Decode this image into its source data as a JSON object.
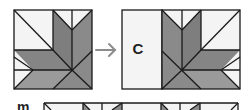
{
  "figure": {
    "labels": {
      "strip": "C",
      "row": "m"
    },
    "colors": {
      "white": "#f4f4f4",
      "gray_dark": "#7e7e7e",
      "gray_mid": "#8a8a8a",
      "gray_light": "#9a9a9a",
      "line": "#1a1a1a",
      "arrow": "#8c8c8c"
    }
  }
}
